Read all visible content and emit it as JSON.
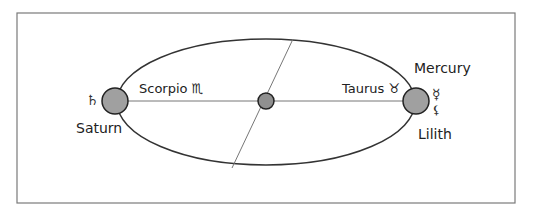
{
  "diagram": {
    "frame": {
      "x": 17,
      "y": 13,
      "w": 498,
      "h": 190,
      "stroke": "#7a7a7a"
    },
    "orbit": {
      "cx": 266,
      "cy": 102,
      "rx": 149,
      "ry": 63,
      "stroke": "#333333"
    },
    "axis_line": {
      "x1": 115,
      "y1": 101,
      "x2": 416,
      "y2": 101,
      "stroke": "#777777"
    },
    "diagonal_line": {
      "x1": 293,
      "y1": 39,
      "x2": 232,
      "y2": 168,
      "stroke": "#777777"
    },
    "bodies": [
      {
        "id": "saturn",
        "cx": 115,
        "cy": 101,
        "r": 13,
        "fill": "#a0a0a0"
      },
      {
        "id": "center",
        "cx": 266,
        "cy": 101,
        "r": 8,
        "fill": "#909090"
      },
      {
        "id": "mercury-lilith",
        "cx": 416,
        "cy": 101,
        "r": 13,
        "fill": "#a0a0a0"
      }
    ],
    "labels": {
      "saturn": "Saturn",
      "scorpio": "Scorpio ♏",
      "taurus": "Taurus ♉",
      "mercury": "Mercury",
      "lilith": "Lilith"
    },
    "glyphs": {
      "saturn": "♄",
      "mercury": "☿",
      "lilith": "⚸"
    }
  }
}
